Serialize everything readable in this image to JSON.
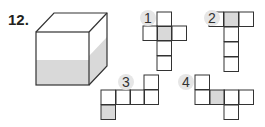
{
  "problem": {
    "number": "12."
  },
  "cube": {
    "front": {
      "x": 36,
      "y": 32,
      "size": 53
    },
    "depth": {
      "dx": 18,
      "dy": -19
    },
    "shade_front_y": 60,
    "shade_color": "#d9d9d9",
    "line_color": "#333333"
  },
  "nets": [
    {
      "label": "1",
      "badge": {
        "x": 140,
        "y": 10
      },
      "cells": [
        [
          157,
          12,
          0
        ],
        [
          157,
          26,
          0
        ],
        [
          143,
          26,
          0
        ],
        [
          172,
          26,
          0
        ],
        [
          157,
          41,
          0
        ],
        [
          157,
          56,
          0
        ]
      ],
      "shaded": [
        [
          157,
          26
        ]
      ]
    },
    {
      "label": "2",
      "badge": {
        "x": 204,
        "y": 10
      },
      "cells": [
        [
          209,
          12
        ],
        [
          224,
          12
        ],
        [
          239,
          12
        ],
        [
          224,
          27
        ],
        [
          224,
          42
        ],
        [
          224,
          57
        ]
      ],
      "shaded": [
        [
          224,
          12
        ]
      ]
    },
    {
      "label": "3",
      "badge": {
        "x": 118,
        "y": 74
      },
      "cells": [
        [
          101,
          90
        ],
        [
          116,
          90
        ],
        [
          130,
          90
        ],
        [
          144,
          90
        ],
        [
          144,
          75
        ],
        [
          101,
          105
        ]
      ],
      "shaded": [
        [
          101,
          105
        ]
      ]
    },
    {
      "label": "4",
      "badge": {
        "x": 178,
        "y": 74
      },
      "cells": [
        [
          195,
          75
        ],
        [
          195,
          90
        ],
        [
          210,
          90
        ],
        [
          224,
          90
        ],
        [
          239,
          90
        ],
        [
          224,
          105
        ]
      ],
      "shaded": [
        [
          210,
          90
        ]
      ]
    }
  ],
  "cell_size": 14.5,
  "colors": {
    "stroke": "#333333",
    "shade": "#d9d9d9",
    "badge_bg": "#e6e6e6"
  }
}
